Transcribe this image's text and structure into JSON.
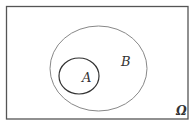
{
  "diagram": {
    "type": "venn",
    "universe": {
      "label": "Ω",
      "x": 6.5,
      "y": 6.5,
      "width": 181.5,
      "height": 112.5,
      "stroke": "#555555"
    },
    "sets": [
      {
        "label": "B",
        "cx": 98.5,
        "cy": 68.5,
        "rx": 48.5,
        "ry": 42.5,
        "stroke": "#888888",
        "label_x": 125,
        "label_y": 66
      },
      {
        "label": "A",
        "cx": 79,
        "cy": 76,
        "rx": 20,
        "ry": 18,
        "stroke": "#333333",
        "label_x": 83,
        "label_y": 82
      }
    ],
    "relation": "A ⊂ B ⊂ Ω"
  }
}
